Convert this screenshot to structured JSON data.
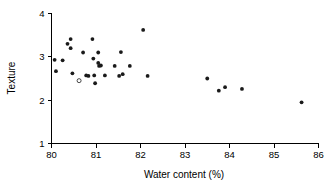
{
  "chart_data": {
    "type": "scatter",
    "title": "",
    "xlabel": "Water content (%)",
    "ylabel": "Texture",
    "xlim": [
      80,
      86
    ],
    "ylim": [
      1,
      4
    ],
    "xticks": [
      80,
      81,
      82,
      83,
      84,
      85,
      86
    ],
    "yticks": [
      1,
      2,
      3,
      4
    ],
    "grid": false,
    "legend": null,
    "series": [
      {
        "name": "filled",
        "marker": "filled-circle",
        "color": "#1a1a1a",
        "points": [
          [
            80.07,
            2.93
          ],
          [
            80.1,
            2.67
          ],
          [
            80.25,
            2.92
          ],
          [
            80.36,
            3.3
          ],
          [
            80.43,
            3.41
          ],
          [
            80.43,
            3.2
          ],
          [
            80.47,
            2.62
          ],
          [
            80.71,
            3.1
          ],
          [
            80.78,
            2.57
          ],
          [
            80.83,
            2.56
          ],
          [
            80.92,
            3.41
          ],
          [
            80.94,
            2.96
          ],
          [
            80.96,
            2.57
          ],
          [
            80.98,
            2.39
          ],
          [
            81.05,
            3.1
          ],
          [
            81.05,
            2.86
          ],
          [
            81.07,
            2.79
          ],
          [
            81.11,
            2.8
          ],
          [
            81.2,
            2.57
          ],
          [
            81.42,
            2.79
          ],
          [
            81.52,
            2.56
          ],
          [
            81.56,
            3.11
          ],
          [
            81.6,
            2.6
          ],
          [
            81.76,
            2.79
          ],
          [
            82.06,
            3.62
          ],
          [
            82.16,
            2.56
          ],
          [
            83.5,
            2.5
          ],
          [
            83.76,
            2.22
          ],
          [
            83.9,
            2.3
          ],
          [
            84.28,
            2.26
          ],
          [
            85.62,
            1.95
          ]
        ]
      },
      {
        "name": "open",
        "marker": "open-circle",
        "color": "#1a1a1a",
        "points": [
          [
            80.62,
            2.45
          ]
        ]
      }
    ]
  },
  "axes": {
    "x_title": "Water content (%)",
    "y_title": "Texture",
    "x_tick_labels": [
      "80",
      "81",
      "82",
      "83",
      "84",
      "85",
      "86"
    ],
    "y_tick_labels": [
      "1",
      "2",
      "3",
      "4"
    ]
  }
}
